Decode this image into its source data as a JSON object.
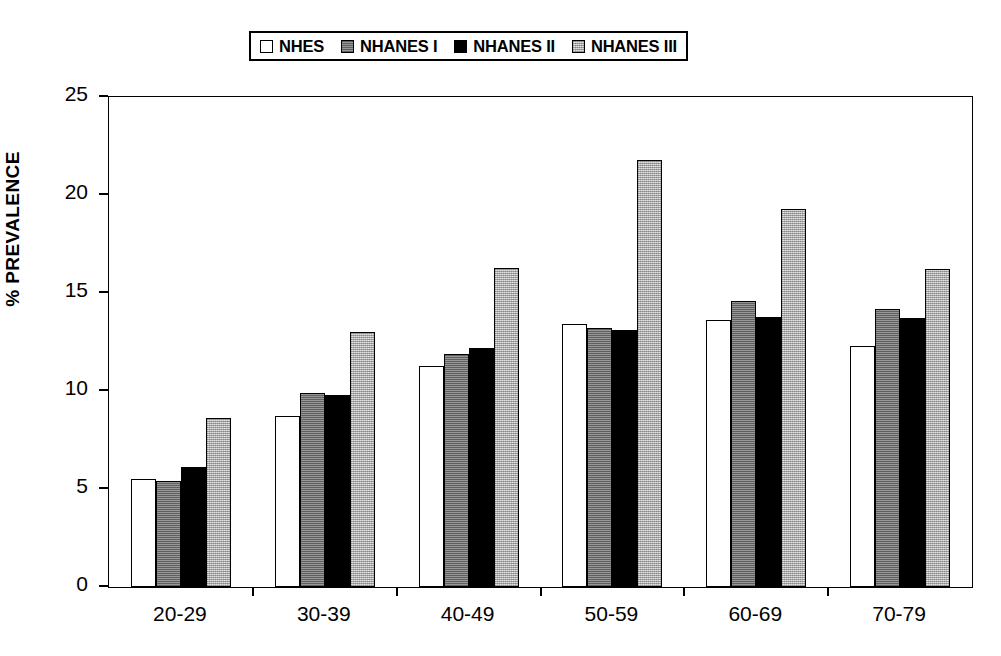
{
  "chart_data": {
    "type": "bar",
    "title": "",
    "subtitle": "",
    "xlabel": "",
    "ylabel": "% PREVALENCE",
    "categories": [
      "20-29",
      "30-39",
      "40-49",
      "50-59",
      "60-69",
      "70-79"
    ],
    "series": [
      {
        "name": "NHES",
        "swatch": "white",
        "color": "#ffffff",
        "values": [
          5.5,
          8.7,
          11.3,
          13.4,
          13.6,
          12.3
        ]
      },
      {
        "name": "NHANES I",
        "swatch": "dark-gray",
        "color": "#808080",
        "values": [
          5.4,
          9.9,
          11.9,
          13.2,
          14.6,
          14.2
        ]
      },
      {
        "name": "NHANES II",
        "swatch": "black",
        "color": "#000000",
        "values": [
          6.1,
          9.8,
          12.2,
          13.1,
          13.8,
          13.7
        ]
      },
      {
        "name": "NHANES III",
        "swatch": "light-gray",
        "color": "#c8c8c8",
        "values": [
          8.6,
          13.0,
          16.3,
          21.8,
          19.3,
          16.2
        ]
      }
    ],
    "ylim": [
      0,
      25
    ],
    "yticks": [
      0,
      5,
      10,
      15,
      20,
      25
    ],
    "ytick_labels": [
      "0",
      "5",
      "10",
      "15",
      "20",
      "25"
    ],
    "grid": false,
    "legend_position": "top-center"
  }
}
